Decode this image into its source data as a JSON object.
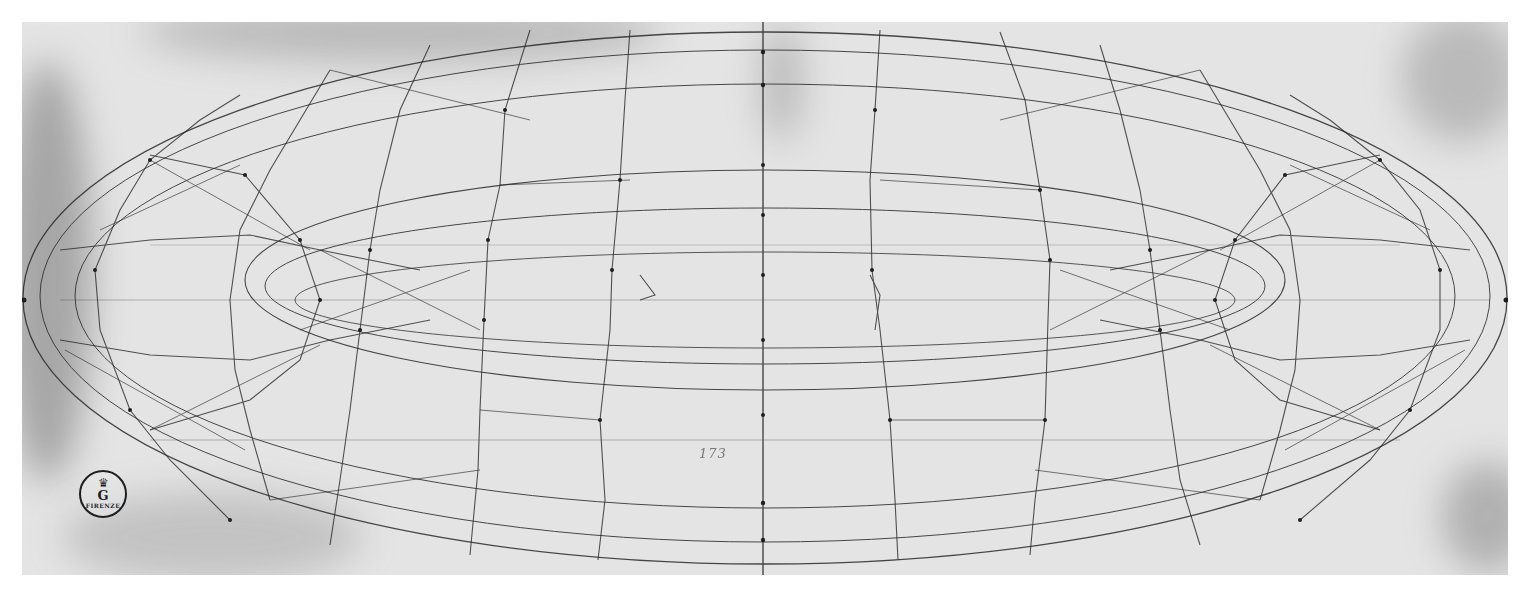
{
  "artwork": {
    "subject": "Perspective study of a faceted torus (mazzocchio)",
    "medium_appearance": "ink/stylus line drawing on paper, grayscale scan"
  },
  "stamp": {
    "crown_glyph": "♛",
    "letter": "G",
    "city": "FIRENZE"
  },
  "inscription": {
    "text": "173"
  },
  "colors": {
    "paper": "#e4e4e4",
    "margin": "#ffffff",
    "ink": "#2a2a2a",
    "stain": "#8a8a8a"
  }
}
